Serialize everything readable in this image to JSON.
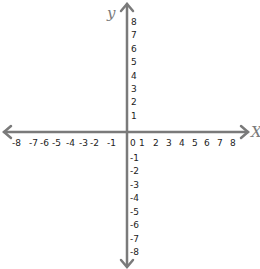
{
  "diagram": {
    "type": "coordinate-plane",
    "x_axis": {
      "name": "X",
      "ticks": [
        "-8",
        "-7",
        "-6",
        "-5",
        "-4",
        "-3",
        "-2",
        "-1",
        "0",
        "1",
        "2",
        "3",
        "4",
        "5",
        "6",
        "7",
        "8"
      ]
    },
    "y_axis": {
      "name": "y",
      "ticks_positive": [
        "8",
        "7",
        "6",
        "5",
        "4",
        "3",
        "2",
        "1"
      ],
      "ticks_negative": [
        "-1",
        "-2",
        "-3",
        "-4",
        "-5",
        "-6",
        "-7",
        "-8"
      ]
    },
    "colors": {
      "axis": "#7a7a7a",
      "labels": "#222222"
    }
  }
}
